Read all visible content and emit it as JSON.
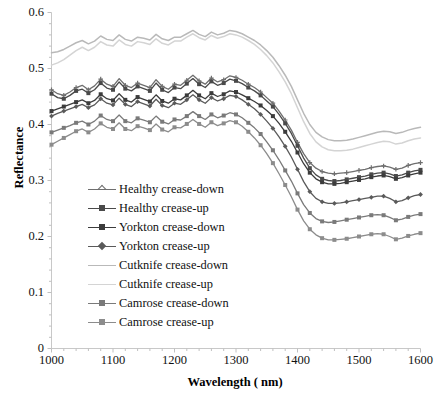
{
  "chart_data": {
    "type": "line",
    "title": "",
    "xlabel": "Wavelength ( nm)",
    "ylabel": "Reflectance",
    "xlim": [
      1000,
      1600
    ],
    "ylim": [
      0,
      0.6
    ],
    "xticks": [
      1000,
      1100,
      1200,
      1300,
      1400,
      1500,
      1600
    ],
    "xtick_labels": [
      "1000",
      "1100",
      "1200",
      "1300",
      "1400",
      "1500",
      "1600"
    ],
    "yticks": [
      0,
      0.1,
      0.2,
      0.3,
      0.4,
      0.5,
      0.6
    ],
    "ytick_labels": [
      "0",
      "0.1",
      "0.2",
      "0.3",
      "0.4",
      "0.5",
      "0.6"
    ],
    "minor_xtick_step": 20,
    "minor_ytick_step": 0.02,
    "grid": false,
    "legend_position": "inside-lower-left",
    "x": [
      1000,
      1010,
      1020,
      1030,
      1040,
      1050,
      1060,
      1070,
      1080,
      1090,
      1100,
      1110,
      1120,
      1130,
      1140,
      1150,
      1160,
      1170,
      1180,
      1190,
      1200,
      1210,
      1220,
      1230,
      1240,
      1250,
      1260,
      1270,
      1280,
      1290,
      1300,
      1310,
      1320,
      1330,
      1340,
      1350,
      1360,
      1370,
      1380,
      1390,
      1400,
      1410,
      1420,
      1430,
      1440,
      1450,
      1460,
      1470,
      1480,
      1490,
      1500,
      1510,
      1520,
      1530,
      1540,
      1550,
      1560,
      1570,
      1580,
      1590,
      1600
    ],
    "series": [
      {
        "name": "Healthy crease-down",
        "color": "#6f6f6f",
        "marker": "cross",
        "values": [
          0.462,
          0.455,
          0.452,
          0.458,
          0.466,
          0.47,
          0.462,
          0.469,
          0.481,
          0.472,
          0.468,
          0.482,
          0.47,
          0.466,
          0.474,
          0.47,
          0.466,
          0.48,
          0.468,
          0.463,
          0.472,
          0.47,
          0.479,
          0.488,
          0.478,
          0.472,
          0.483,
          0.476,
          0.48,
          0.487,
          0.484,
          0.479,
          0.472,
          0.466,
          0.458,
          0.448,
          0.438,
          0.424,
          0.408,
          0.39,
          0.368,
          0.348,
          0.332,
          0.322,
          0.316,
          0.313,
          0.312,
          0.313,
          0.314,
          0.316,
          0.318,
          0.32,
          0.323,
          0.325,
          0.326,
          0.324,
          0.32,
          0.322,
          0.327,
          0.33,
          0.332
        ]
      },
      {
        "name": "Healthy crease-up",
        "color": "#4a4a4a",
        "marker": "square",
        "values": [
          0.455,
          0.448,
          0.446,
          0.452,
          0.46,
          0.463,
          0.456,
          0.462,
          0.474,
          0.465,
          0.462,
          0.476,
          0.464,
          0.46,
          0.468,
          0.464,
          0.46,
          0.474,
          0.462,
          0.457,
          0.466,
          0.464,
          0.473,
          0.482,
          0.472,
          0.466,
          0.477,
          0.47,
          0.474,
          0.481,
          0.478,
          0.473,
          0.466,
          0.46,
          0.452,
          0.442,
          0.432,
          0.418,
          0.402,
          0.384,
          0.362,
          0.34,
          0.322,
          0.31,
          0.303,
          0.3,
          0.299,
          0.3,
          0.302,
          0.304,
          0.306,
          0.308,
          0.311,
          0.313,
          0.314,
          0.312,
          0.308,
          0.31,
          0.314,
          0.317,
          0.319
        ]
      },
      {
        "name": "Yorkton crease-down",
        "color": "#3c3c3c",
        "marker": "square",
        "values": [
          0.424,
          0.428,
          0.432,
          0.436,
          0.44,
          0.444,
          0.438,
          0.443,
          0.454,
          0.446,
          0.443,
          0.455,
          0.444,
          0.44,
          0.449,
          0.445,
          0.441,
          0.453,
          0.442,
          0.438,
          0.446,
          0.444,
          0.452,
          0.461,
          0.452,
          0.446,
          0.456,
          0.45,
          0.454,
          0.46,
          0.458,
          0.453,
          0.447,
          0.441,
          0.434,
          0.425,
          0.415,
          0.402,
          0.387,
          0.37,
          0.35,
          0.33,
          0.314,
          0.303,
          0.297,
          0.294,
          0.294,
          0.295,
          0.297,
          0.299,
          0.301,
          0.303,
          0.306,
          0.308,
          0.309,
          0.307,
          0.303,
          0.305,
          0.309,
          0.312,
          0.314
        ]
      },
      {
        "name": "Yorkton crease-up",
        "color": "#5a5a5a",
        "marker": "diamond",
        "values": [
          0.415,
          0.42,
          0.424,
          0.428,
          0.432,
          0.436,
          0.43,
          0.435,
          0.446,
          0.438,
          0.435,
          0.447,
          0.436,
          0.432,
          0.441,
          0.437,
          0.433,
          0.445,
          0.434,
          0.43,
          0.438,
          0.436,
          0.444,
          0.453,
          0.444,
          0.438,
          0.448,
          0.442,
          0.446,
          0.452,
          0.45,
          0.444,
          0.436,
          0.428,
          0.418,
          0.406,
          0.393,
          0.378,
          0.361,
          0.342,
          0.32,
          0.298,
          0.28,
          0.268,
          0.262,
          0.259,
          0.259,
          0.26,
          0.262,
          0.264,
          0.266,
          0.268,
          0.27,
          0.272,
          0.272,
          0.268,
          0.262,
          0.264,
          0.269,
          0.273,
          0.275
        ]
      },
      {
        "name": "Cutknife crease-down",
        "color": "#b9b9b9",
        "marker": "none",
        "values": [
          0.528,
          0.53,
          0.534,
          0.54,
          0.546,
          0.55,
          0.544,
          0.549,
          0.558,
          0.552,
          0.55,
          0.56,
          0.552,
          0.549,
          0.556,
          0.554,
          0.551,
          0.561,
          0.553,
          0.55,
          0.556,
          0.556,
          0.562,
          0.568,
          0.561,
          0.557,
          0.565,
          0.56,
          0.563,
          0.568,
          0.566,
          0.562,
          0.556,
          0.55,
          0.542,
          0.532,
          0.52,
          0.505,
          0.488,
          0.468,
          0.444,
          0.42,
          0.4,
          0.386,
          0.378,
          0.373,
          0.371,
          0.371,
          0.372,
          0.374,
          0.377,
          0.38,
          0.383,
          0.386,
          0.388,
          0.387,
          0.384,
          0.386,
          0.39,
          0.393,
          0.395
        ]
      },
      {
        "name": "Cutknife crease-up",
        "color": "#d4d4d4",
        "marker": "none",
        "values": [
          0.506,
          0.51,
          0.516,
          0.524,
          0.532,
          0.538,
          0.532,
          0.538,
          0.548,
          0.542,
          0.54,
          0.551,
          0.543,
          0.54,
          0.548,
          0.546,
          0.543,
          0.553,
          0.545,
          0.542,
          0.549,
          0.549,
          0.556,
          0.562,
          0.555,
          0.551,
          0.559,
          0.554,
          0.557,
          0.562,
          0.56,
          0.556,
          0.55,
          0.543,
          0.534,
          0.523,
          0.51,
          0.494,
          0.476,
          0.455,
          0.43,
          0.405,
          0.384,
          0.369,
          0.36,
          0.355,
          0.353,
          0.353,
          0.354,
          0.356,
          0.359,
          0.362,
          0.365,
          0.368,
          0.37,
          0.369,
          0.365,
          0.367,
          0.371,
          0.374,
          0.376
        ]
      },
      {
        "name": "Camrose crease-down",
        "color": "#7a7a7a",
        "marker": "square",
        "values": [
          0.386,
          0.39,
          0.394,
          0.398,
          0.403,
          0.406,
          0.4,
          0.406,
          0.416,
          0.409,
          0.406,
          0.417,
          0.406,
          0.403,
          0.411,
          0.408,
          0.404,
          0.415,
          0.405,
          0.401,
          0.409,
          0.408,
          0.415,
          0.423,
          0.415,
          0.409,
          0.418,
          0.412,
          0.416,
          0.421,
          0.418,
          0.412,
          0.403,
          0.394,
          0.383,
          0.369,
          0.354,
          0.337,
          0.318,
          0.299,
          0.277,
          0.257,
          0.242,
          0.232,
          0.227,
          0.225,
          0.226,
          0.228,
          0.23,
          0.232,
          0.234,
          0.236,
          0.238,
          0.239,
          0.238,
          0.234,
          0.229,
          0.231,
          0.235,
          0.238,
          0.24
        ]
      },
      {
        "name": "Camrose crease-up",
        "color": "#8c8c8c",
        "marker": "square",
        "values": [
          0.364,
          0.37,
          0.376,
          0.382,
          0.388,
          0.392,
          0.386,
          0.392,
          0.402,
          0.395,
          0.392,
          0.403,
          0.392,
          0.389,
          0.397,
          0.394,
          0.39,
          0.401,
          0.391,
          0.387,
          0.395,
          0.394,
          0.401,
          0.409,
          0.401,
          0.395,
          0.404,
          0.398,
          0.402,
          0.407,
          0.404,
          0.397,
          0.387,
          0.376,
          0.363,
          0.348,
          0.331,
          0.312,
          0.292,
          0.271,
          0.248,
          0.228,
          0.213,
          0.203,
          0.197,
          0.194,
          0.194,
          0.195,
          0.196,
          0.198,
          0.2,
          0.202,
          0.204,
          0.205,
          0.204,
          0.2,
          0.195,
          0.197,
          0.201,
          0.204,
          0.206
        ]
      }
    ]
  }
}
